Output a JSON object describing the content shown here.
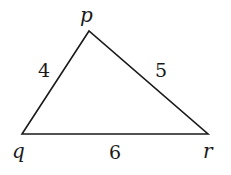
{
  "diagram": {
    "type": "triangle",
    "stroke_color": "#1a1a1a",
    "background": "#ffffff",
    "vertices": [
      {
        "name": "p",
        "x": 89,
        "y": 31,
        "label_x": 80,
        "label_y": 22
      },
      {
        "name": "q",
        "x": 22,
        "y": 134,
        "label_x": 12,
        "label_y": 158
      },
      {
        "name": "r",
        "x": 208,
        "y": 134,
        "label_x": 203,
        "label_y": 158
      }
    ],
    "sides": [
      {
        "from": "q",
        "to": "p",
        "length": "4",
        "label_x": 38,
        "label_y": 77
      },
      {
        "from": "p",
        "to": "r",
        "length": "5",
        "label_x": 155,
        "label_y": 77
      },
      {
        "from": "q",
        "to": "r",
        "length": "6",
        "label_x": 109,
        "label_y": 159
      }
    ]
  }
}
